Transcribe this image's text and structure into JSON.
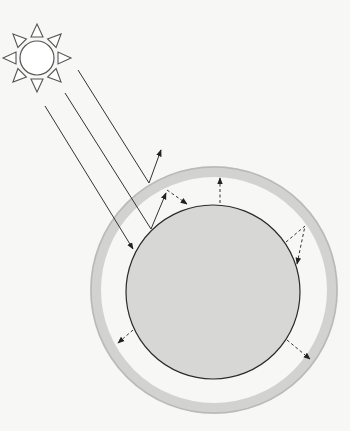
{
  "colors": {
    "background": "#f7f7f6",
    "planet_fill": "#d7d7d6",
    "planet_stroke": "#2b2b2b",
    "atmosphere": "#d2d2d1",
    "atmosphere_edge": "#b9b9b8",
    "ray": "#333333",
    "sun_stroke": "#555555",
    "sun_fill": "#ffffff"
  },
  "sun": {
    "icon": "sun-icon",
    "cx": 37,
    "cy": 58,
    "r": 17,
    "ray_tip": 34,
    "ray_base": 21,
    "ray_half_width": 6,
    "ray_count": 8
  },
  "planet": {
    "cx": 213,
    "cy": 292,
    "r": 87
  },
  "atmosphere": {
    "cx": 214,
    "cy": 290,
    "r": 118.5,
    "width": 11
  },
  "incoming_rays": [
    {
      "name": "incoming-ray-reflected-by-atmosphere",
      "points": [
        [
          78,
          70
        ],
        [
          149,
          183
        ]
      ],
      "arrow": false
    },
    {
      "name": "incoming-ray-reflected-by-surface",
      "points": [
        [
          65,
          93
        ],
        [
          151,
          229
        ]
      ],
      "arrow": false
    },
    {
      "name": "incoming-ray-absorbed",
      "points": [
        [
          45,
          106
        ],
        [
          133,
          249
        ]
      ],
      "arrow": true
    }
  ],
  "reflected_rays": [
    {
      "name": "atmosphere-reflection-arrow",
      "points": [
        [
          149,
          183
        ],
        [
          161,
          150
        ]
      ],
      "arrow": true
    },
    {
      "name": "surface-reflection-arrow",
      "points": [
        [
          151,
          229
        ],
        [
          166,
          193
        ]
      ],
      "arrow": true
    }
  ],
  "infrared_rays": [
    {
      "name": "back-radiation-arrow",
      "points": [
        [
          167,
          190
        ],
        [
          187,
          204
        ]
      ],
      "arrow": true
    },
    {
      "name": "surface-emission-arrow-top",
      "points": [
        [
          220,
          203
        ],
        [
          220,
          178
        ]
      ],
      "arrow": true
    },
    {
      "name": "trapped-radiation-arrow",
      "points": [
        [
          286,
          242
        ],
        [
          305,
          226
        ],
        [
          297,
          264
        ]
      ],
      "arrow": true
    },
    {
      "name": "surface-emission-arrow-lower-left",
      "points": [
        [
          133,
          330
        ],
        [
          118,
          343
        ]
      ],
      "arrow": true
    },
    {
      "name": "surface-emission-arrow-lower-right",
      "points": [
        [
          287,
          340
        ],
        [
          310,
          359
        ]
      ],
      "arrow": true
    }
  ]
}
